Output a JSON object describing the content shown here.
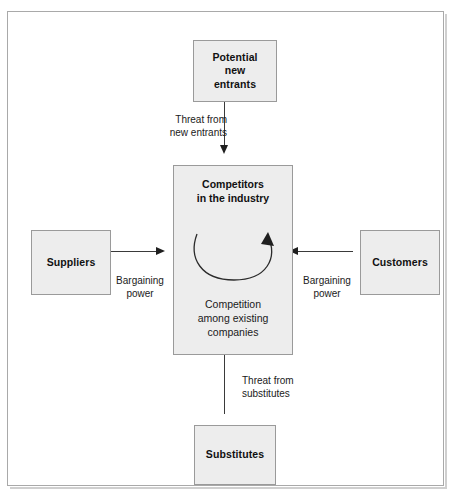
{
  "diagram": {
    "background_color": "#ffffff",
    "node_fill_color": "#ededed",
    "node_border_color": "#9a9a9a",
    "line_color": "#3a3a3a"
  },
  "nodes": {
    "entrants": {
      "label": "Potential\nnew\nentrants"
    },
    "suppliers": {
      "label": "Suppliers"
    },
    "customers": {
      "label": "Customers"
    },
    "substitutes": {
      "label": "Substitutes"
    },
    "center": {
      "title": "Competitors\nin the industry",
      "subtitle": "Competition\namong existing\ncompanies"
    }
  },
  "edges": {
    "threat_new_entrants": "Threat from\nnew entrants",
    "threat_substitutes": "Threat from\nsubstitutes",
    "supplier_power": "Bargaining\npower",
    "customer_power": "Bargaining\npower"
  },
  "icons": {
    "cycle": "circular-rivalry-arrow"
  }
}
